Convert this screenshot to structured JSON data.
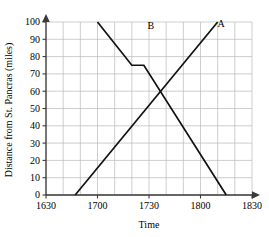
{
  "chart_data": {
    "type": "line",
    "title": "",
    "xlabel": "Time",
    "ylabel": "Distance from St. Pancras (miles)",
    "xlim": [
      1630,
      1830
    ],
    "ylim": [
      0,
      100
    ],
    "grid": true,
    "x_major_ticks": [
      1630,
      1700,
      1730,
      1800,
      1830
    ],
    "x_tick_labels": [
      "1630",
      "1700",
      "1730",
      "1800",
      "1830"
    ],
    "x_minor_step": 10,
    "y_ticks": [
      0,
      10,
      20,
      30,
      40,
      50,
      60,
      70,
      80,
      90,
      100
    ],
    "y_tick_labels": [
      "0",
      "10",
      "20",
      "30",
      "40",
      "50",
      "60",
      "70",
      "80",
      "90",
      "100"
    ],
    "legend_position": "inline-endpoint-labels",
    "annotations": [
      {
        "label": "A",
        "x": 1812,
        "y": 97
      },
      {
        "label": "B",
        "x": 1691,
        "y": 96
      }
    ],
    "series": [
      {
        "name": "A",
        "label": "A",
        "color": "#111111",
        "description": "Train A travelling away from St. Pancras at constant speed",
        "points": [
          {
            "x": 1647,
            "y": 0
          },
          {
            "x": 1810,
            "y": 100
          }
        ]
      },
      {
        "name": "B",
        "label": "B",
        "color": "#111111",
        "description": "Train B travelling towards St. Pancras with a stop between 1720 and 1727",
        "points": [
          {
            "x": 1700,
            "y": 100
          },
          {
            "x": 1720,
            "y": 75
          },
          {
            "x": 1727,
            "y": 75
          },
          {
            "x": 1815,
            "y": 0
          }
        ]
      }
    ]
  },
  "figure": {
    "y_axis_title": "Distance from St. Pancras (miles)",
    "x_axis_title": "Time"
  }
}
